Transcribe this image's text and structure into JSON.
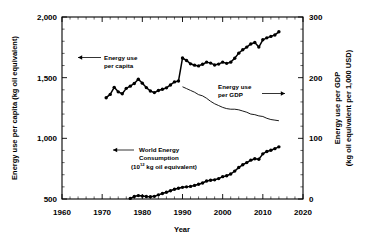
{
  "figure": {
    "background_color": "#ffffff",
    "ink_color": "#000000"
  },
  "chart_data": {
    "type": "line",
    "title": "",
    "xlabel": "Year",
    "ylabel": "Energy use per capita (kg oil equivalent)",
    "y2label": "Energy use per GDP\n(kg oil equivalent per 1,000 USD)",
    "y2label_line1": "Energy use per GDP",
    "y2label_line2": "(kg oil equivalent per 1,000 USD)",
    "xlim": [
      1960,
      2020
    ],
    "ylim": [
      500,
      2000
    ],
    "y2lim": [
      0,
      300
    ],
    "xticks": [
      1960,
      1970,
      1980,
      1990,
      2000,
      2010,
      2020
    ],
    "xticklabels": [
      "1960",
      "1970",
      "1980",
      "1990",
      "2000",
      "2010",
      "2020"
    ],
    "xminor_step": 2,
    "yticks": [
      500,
      1000,
      1500,
      2000
    ],
    "yticklabels": [
      "500",
      "1,000",
      "1,500",
      "2,000"
    ],
    "yminor_step": 100,
    "y2ticks": [
      0,
      100,
      200,
      300
    ],
    "y2ticklabels": [
      "0",
      "100",
      "200",
      "300"
    ],
    "y2minor_step": 20,
    "grid": false,
    "legend_position": "inline-annotations",
    "annotations": [
      {
        "name": "energy-use-per-capita-annotation",
        "lines": [
          "Energy use",
          "per capita"
        ],
        "arrow_direction": "left",
        "target_axis": "left"
      },
      {
        "name": "energy-use-per-gdp-annotation",
        "lines": [
          "Energy use",
          "per GDP"
        ],
        "arrow_direction": "right",
        "target_axis": "right"
      },
      {
        "name": "world-energy-consumption-annotation",
        "lines": [
          "World Energy",
          "Consumption",
          "(10^12 kg oil equivalent)"
        ],
        "line3_prefix": "(10",
        "line3_exponent": "12",
        "line3_suffix": " kg oil equivalent)",
        "arrow_direction": "left",
        "target_axis": "left"
      }
    ],
    "series": [
      {
        "name": "Energy use per capita",
        "axis": "left",
        "units": "kg oil equivalent",
        "markers": true,
        "x": [
          1971,
          1972,
          1973,
          1974,
          1975,
          1976,
          1977,
          1978,
          1979,
          1980,
          1981,
          1982,
          1983,
          1984,
          1985,
          1986,
          1987,
          1988,
          1989,
          1990,
          1991,
          1992,
          1993,
          1994,
          1995,
          1996,
          1997,
          1998,
          1999,
          2000,
          2001,
          2002,
          2003,
          2004,
          2005,
          2006,
          2007,
          2008,
          2009,
          2010,
          2011,
          2012,
          2013,
          2014
        ],
        "values": [
          1335,
          1362,
          1420,
          1383,
          1367,
          1412,
          1430,
          1452,
          1487,
          1455,
          1418,
          1390,
          1377,
          1394,
          1404,
          1416,
          1440,
          1465,
          1472,
          1662,
          1642,
          1614,
          1603,
          1597,
          1610,
          1628,
          1620,
          1605,
          1612,
          1628,
          1618,
          1628,
          1660,
          1702,
          1730,
          1752,
          1778,
          1790,
          1752,
          1812,
          1828,
          1840,
          1852,
          1878
        ]
      },
      {
        "name": "Energy use per GDP",
        "axis": "right",
        "units": "kg oil equivalent per 1,000 USD",
        "markers": false,
        "x": [
          1990,
          1991,
          1992,
          1993,
          1994,
          1995,
          1996,
          1997,
          1998,
          1999,
          2000,
          2001,
          2002,
          2003,
          2004,
          2005,
          2006,
          2007,
          2008,
          2009,
          2010,
          2011,
          2012,
          2013,
          2014
        ],
        "values": [
          185,
          182,
          179,
          176,
          172,
          170,
          166,
          161,
          157,
          154,
          151,
          149,
          148,
          148,
          147,
          145,
          143,
          140,
          139,
          137,
          136,
          133,
          131,
          130,
          129
        ]
      },
      {
        "name": "World Energy Consumption",
        "axis": "left",
        "units": "10^12 kg oil equivalent",
        "markers": true,
        "x": [
          1977,
          1978,
          1979,
          1980,
          1981,
          1982,
          1983,
          1984,
          1985,
          1986,
          1987,
          1988,
          1989,
          1990,
          1991,
          1992,
          1993,
          1994,
          1995,
          1996,
          1997,
          1998,
          1999,
          2000,
          2001,
          2002,
          2003,
          2004,
          2005,
          2006,
          2007,
          2008,
          2009,
          2010,
          2011,
          2012,
          2013,
          2014
        ],
        "values": [
          505,
          520,
          528,
          524,
          520,
          518,
          522,
          534,
          545,
          556,
          568,
          580,
          588,
          596,
          600,
          604,
          612,
          622,
          632,
          648,
          655,
          658,
          668,
          684,
          692,
          706,
          730,
          760,
          782,
          800,
          820,
          832,
          828,
          872,
          892,
          902,
          915,
          930
        ]
      }
    ]
  }
}
